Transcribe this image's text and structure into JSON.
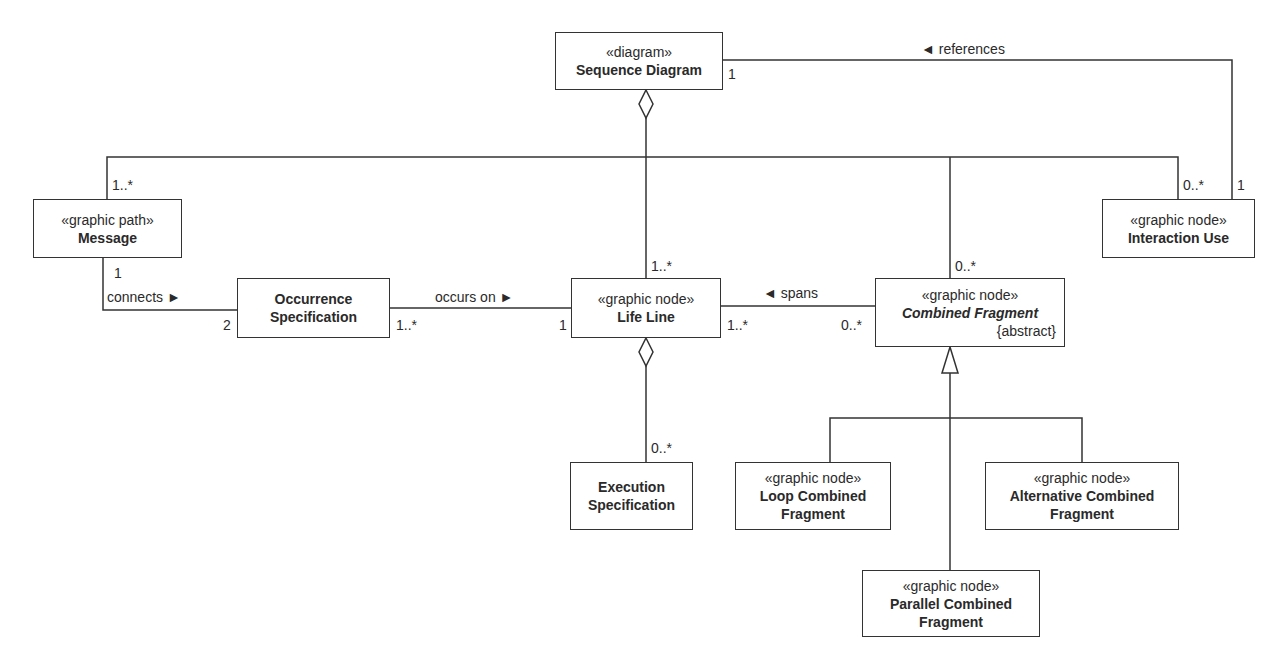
{
  "diagram": {
    "type": "UML class diagram (metamodel)",
    "nodes": [
      {
        "id": "sequence-diagram",
        "stereotype": "«diagram»",
        "name": "Sequence Diagram"
      },
      {
        "id": "message",
        "stereotype": "«graphic path»",
        "name": "Message"
      },
      {
        "id": "interaction-use",
        "stereotype": "«graphic node»",
        "name": "Interaction Use"
      },
      {
        "id": "occurrence-specification",
        "stereotype": "",
        "name_line1": "Occurrence",
        "name_line2": "Specification"
      },
      {
        "id": "life-line",
        "stereotype": "«graphic node»",
        "name": "Life Line"
      },
      {
        "id": "combined-fragment",
        "stereotype": "«graphic node»",
        "name": "Combined Fragment",
        "constraint": "{abstract}",
        "italic": true
      },
      {
        "id": "execution-specification",
        "stereotype": "",
        "name_line1": "Execution",
        "name_line2": "Specification"
      },
      {
        "id": "loop-combined-fragment",
        "stereotype": "«graphic node»",
        "name_line1": "Loop Combined",
        "name_line2": "Fragment"
      },
      {
        "id": "alternative-combined-fragment",
        "stereotype": "«graphic node»",
        "name_line1": "Alternative Combined",
        "name_line2": "Fragment"
      },
      {
        "id": "parallel-combined-fragment",
        "stereotype": "«graphic node»",
        "name_line1": "Parallel Combined",
        "name_line2": "Fragment"
      }
    ],
    "edges": [
      {
        "from": "sequence-diagram",
        "to": "message",
        "kind": "aggregation",
        "target_mult": "1..*"
      },
      {
        "from": "sequence-diagram",
        "to": "life-line",
        "kind": "aggregation",
        "target_mult": "1..*"
      },
      {
        "from": "sequence-diagram",
        "to": "combined-fragment",
        "kind": "aggregation",
        "target_mult": "0..*"
      },
      {
        "from": "sequence-diagram",
        "to": "interaction-use",
        "kind": "aggregation",
        "target_mult": "0..*"
      },
      {
        "from": "interaction-use",
        "to": "sequence-diagram",
        "kind": "association",
        "label": "◄ references",
        "source_mult": "1",
        "target_mult": "1"
      },
      {
        "from": "message",
        "to": "occurrence-specification",
        "kind": "association",
        "label": "connects ►",
        "source_mult": "1",
        "target_mult": "2"
      },
      {
        "from": "occurrence-specification",
        "to": "life-line",
        "kind": "association",
        "label": "occurs on ►",
        "source_mult": "1..*",
        "target_mult": "1"
      },
      {
        "from": "combined-fragment",
        "to": "life-line",
        "kind": "association",
        "label": "◄ spans",
        "source_mult": "0..*",
        "target_mult": "1..*"
      },
      {
        "from": "life-line",
        "to": "execution-specification",
        "kind": "aggregation",
        "target_mult": "0..*"
      },
      {
        "from": "loop-combined-fragment",
        "to": "combined-fragment",
        "kind": "generalization"
      },
      {
        "from": "alternative-combined-fragment",
        "to": "combined-fragment",
        "kind": "generalization"
      },
      {
        "from": "parallel-combined-fragment",
        "to": "combined-fragment",
        "kind": "generalization"
      }
    ]
  },
  "labels": {
    "references": "◄ references",
    "connects": "connects ►",
    "occurs_on": "occurs on ►",
    "spans": "◄ spans"
  },
  "multiplicities": {
    "sd_references": "1",
    "iu_references": "1",
    "message_top": "1..*",
    "iu_top": "0..*",
    "cf_top": "0..*",
    "ll_top": "1..*",
    "message_bottom": "1",
    "os_left": "2",
    "os_right": "1..*",
    "ll_left": "1",
    "ll_right": "1..*",
    "cf_left": "0..*",
    "es_top": "0..*"
  },
  "colors": {
    "line": "#333333",
    "text": "#2a2a2a",
    "background": "#ffffff"
  }
}
